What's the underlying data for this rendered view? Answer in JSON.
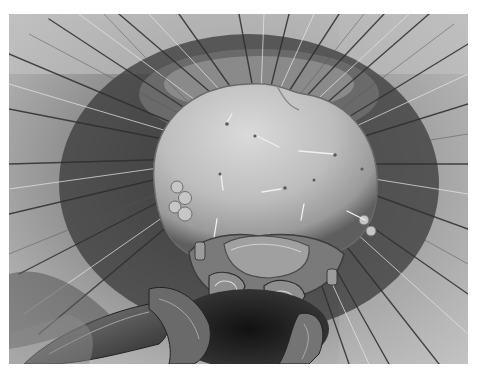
{
  "image": {
    "subject": "Scanning electron micrograph of a caterpillar head with bristles",
    "palette": {
      "background_light": "#c9c9c9",
      "background_mid": "#9a9a9a",
      "shadow": "#1e1e1e",
      "head_highlight": "#d8d8d8",
      "head_mid": "#b4b4b4",
      "head_edge": "#6c6c6c",
      "border": "#ffffff"
    },
    "frame": {
      "x": 9,
      "y": 14,
      "width": 459,
      "height": 350
    }
  }
}
